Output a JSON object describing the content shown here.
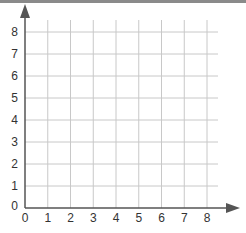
{
  "chart_data": {
    "type": "coordinate-grid",
    "title": "",
    "xlabel": "",
    "ylabel": "",
    "x_ticks": [
      "0",
      "1",
      "2",
      "3",
      "4",
      "5",
      "6",
      "7",
      "8"
    ],
    "y_ticks": [
      "0",
      "1",
      "2",
      "3",
      "4",
      "5",
      "6",
      "7",
      "8"
    ],
    "xlim": [
      0,
      8
    ],
    "ylim": [
      0,
      8
    ],
    "grid": true,
    "first_quadrant": true,
    "arrows": {
      "x_axis": "right",
      "y_axis": "up"
    },
    "colors": {
      "grid": "#c8c8c8",
      "axis": "#555555",
      "text": "#333333",
      "border": "#8a8a8a"
    },
    "points": []
  }
}
